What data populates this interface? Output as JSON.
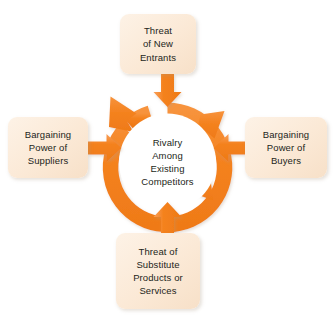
{
  "diagram": {
    "colors": {
      "arrow_orange": "#F4821F",
      "arrow_orange_light": "#F9A05A",
      "box_fill": "#FBE9D6",
      "box_fill_light": "#FDF2E6",
      "text": "#231F20",
      "background": "#FFFFFF"
    },
    "center": {
      "name": "rivalry-among-existing-competitors",
      "label": "Rivalry\nAmong\nExisting\nCompetitors",
      "ring_arrowheads": 3,
      "ring_direction": "clockwise"
    },
    "forces": [
      {
        "position": "top",
        "name": "threat-of-new-entrants",
        "label": "Threat\nof New\nEntrants",
        "arrow_direction": "down"
      },
      {
        "position": "left",
        "name": "bargaining-power-of-suppliers",
        "label": "Bargaining\nPower of\nSuppliers",
        "arrow_direction": "right"
      },
      {
        "position": "right",
        "name": "bargaining-power-of-buyers",
        "label": "Bargaining\nPower of\nBuyers",
        "arrow_direction": "left"
      },
      {
        "position": "bottom",
        "name": "threat-of-substitute-products-or-services",
        "label": "Threat of\nSubstitute\nProducts or\nServices",
        "arrow_direction": "up"
      }
    ]
  }
}
